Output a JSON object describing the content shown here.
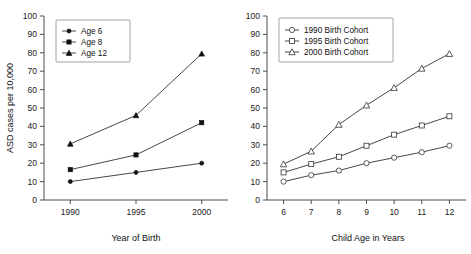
{
  "figure": {
    "panels": [
      "left",
      "right"
    ]
  },
  "chart_data": [
    {
      "type": "line",
      "panel": "left",
      "title": "",
      "xlabel": "Year of Birth",
      "ylabel": "ASD cases per 10,000",
      "categories": [
        "1990",
        "1995",
        "2000"
      ],
      "x": [
        1990,
        1995,
        2000
      ],
      "xlim": [
        1988,
        2002
      ],
      "ylim": [
        0,
        100
      ],
      "ytick_labels": [
        "0",
        "10",
        "20",
        "30",
        "40",
        "50",
        "60",
        "70",
        "80",
        "90",
        "100"
      ],
      "yticks": [
        0,
        10,
        20,
        30,
        40,
        50,
        60,
        70,
        80,
        90,
        100
      ],
      "xtick_labels": [
        "1990",
        "1995",
        "2000"
      ],
      "grid": false,
      "legend_position": "top-left",
      "series": [
        {
          "name": "Age 6",
          "marker": "circle-filled",
          "values": [
            10,
            15,
            20
          ]
        },
        {
          "name": "Age 8",
          "marker": "square-filled",
          "values": [
            16.5,
            24.5,
            42
          ]
        },
        {
          "name": "Age 12",
          "marker": "triangle-filled",
          "values": [
            30.5,
            46,
            79.5
          ]
        }
      ]
    },
    {
      "type": "line",
      "panel": "right",
      "title": "",
      "xlabel": "Child Age in Years",
      "ylabel": "",
      "categories": [
        "6",
        "7",
        "8",
        "9",
        "10",
        "11",
        "12"
      ],
      "x": [
        6,
        7,
        8,
        9,
        10,
        11,
        12
      ],
      "xlim": [
        5.4,
        12.6
      ],
      "ylim": [
        0,
        100
      ],
      "ytick_labels": [
        "0",
        "10",
        "20",
        "30",
        "40",
        "50",
        "60",
        "70",
        "80",
        "90",
        "100"
      ],
      "yticks": [
        0,
        10,
        20,
        30,
        40,
        50,
        60,
        70,
        80,
        90,
        100
      ],
      "xtick_labels": [
        "6",
        "7",
        "8",
        "9",
        "10",
        "11",
        "12"
      ],
      "grid": false,
      "legend_position": "top-left",
      "series": [
        {
          "name": "1990 Birth Cohort",
          "marker": "circle-open",
          "values": [
            10,
            13.5,
            16,
            20,
            23,
            26,
            29.5
          ]
        },
        {
          "name": "1995 Birth Cohort",
          "marker": "square-open",
          "values": [
            15,
            19.5,
            23.5,
            29.5,
            35.5,
            40.5,
            45.5
          ]
        },
        {
          "name": "2000 Birth Cohort",
          "marker": "triangle-open",
          "values": [
            19.5,
            26.5,
            41,
            51.5,
            61,
            71.5,
            79.5
          ]
        }
      ]
    }
  ]
}
